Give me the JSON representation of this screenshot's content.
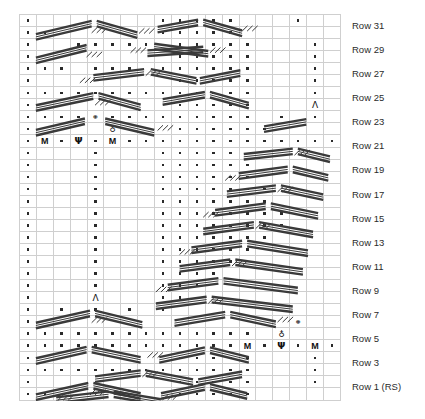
{
  "chart": {
    "columns": 19,
    "rows": 32,
    "cell_width_px": 16.9,
    "cell_height_px": 12.05,
    "colors": {
      "grid_line": "#cfcfcf",
      "border": "#9a9a9a",
      "shaded_cell": "#6e6e6e",
      "background_cell": "#ffffff",
      "symbol": "#2a2a2a",
      "cable_stroke": "#3a3a3a",
      "label_text": "#2b2b2b"
    },
    "row_labels": [
      "Row 31",
      "Row 29",
      "Row 27",
      "Row 25",
      "Row 23",
      "Row 21",
      "Row 19",
      "Row 17",
      "Row 15",
      "Row 13",
      "Row 11",
      "Row 9",
      "Row 7",
      "Row 5",
      "Row 3",
      "Row 1 (RS)"
    ],
    "row_label_numbers": [
      31,
      29,
      27,
      25,
      23,
      21,
      19,
      17,
      15,
      13,
      11,
      9,
      7,
      5,
      3,
      1
    ],
    "rs_marker": "(RS)",
    "symbol_legend": [
      {
        "key": "purl",
        "glyph": "dot",
        "name": "purl-dot-symbol"
      },
      {
        "key": "shaded",
        "glyph": "block",
        "name": "shaded-cell-symbol"
      },
      {
        "key": "make_one",
        "glyph": "M",
        "name": "make-one-symbol"
      },
      {
        "key": "psy",
        "glyph": "Ψ",
        "name": "psi-symbol"
      },
      {
        "key": "central_dec",
        "glyph": "Λ",
        "name": "central-decrease-symbol"
      },
      {
        "key": "bobble_top",
        "glyph": "♀",
        "name": "bobble-symbol"
      },
      {
        "key": "bobble_bottom",
        "glyph": "♁",
        "name": "bobble-lower-symbol"
      },
      {
        "key": "cable",
        "glyph": "diagonal-line",
        "name": "travelling-stitch-symbol"
      }
    ],
    "grid": [
      "dggg.ggg.......d.ddd.dddd.d",
      "d...............d.d..d...d.",
      "dggg.ggg.......d.ddd.dddd.d"
    ],
    "cells": [
      [
        "d",
        "b",
        "b",
        "b",
        "d",
        "b",
        "b",
        "b",
        "d",
        "d",
        "d",
        "d",
        "d",
        "d",
        "g",
        "g",
        "g",
        "d",
        "g",
        "g",
        "g",
        "d"
      ],
      [
        "d",
        "d",
        "b",
        "b",
        "b",
        "b",
        "b",
        "d",
        "d",
        "d",
        "d",
        "d",
        "d",
        "d",
        "g",
        "g",
        "g",
        "d",
        "g",
        "g",
        "g",
        "d"
      ]
    ],
    "map": {
      "d": "purl dot",
      "b": "blank / travelling stitch",
      "g": "shaded (knit ground)",
      "M": "make one",
      "P": "psi",
      "L": "central decrease",
      "o": "bobble upper",
      "u": "bobble lower"
    },
    "row_data": [
      "d.b.b.bbdddddgggdgggd",
      "ddbbbbbbddddd.ggg.gggd",
      "d..ddddd.dddddgggdgggd",
      "dbbbbbbbbdddddgggdgggd",
      "ddd.ddd.ddddddgggdgggd",
      "dbbbbbbbbdddddgggdgggd",
      "ddddddddddddddgggdgggd",
      "dbbbbbbbbdddddgggLgggd",
      "ddddoddddddddd.d.d.d.d",
      "dbbbbubbbddddddbbbbbbd",
      "dMdPdMddddddddddddddd",
      "dgggdgggddddd.bbbbbb.d",
      "dgggdgggddddddbbbbbbbd",
      "dgggdgggdddddd.bbbbb.d",
      "dgggdgggdddddddbbbbbdd",
      "dgggdgggddddddd.bbb..d",
      "dgggdgggdddddddd.b.ddd",
      "dgggdgggddddddddbbbbdd",
      "dgggdgggdddddddbbbbbbd",
      "dgggdgggddddddbbbbbbbd",
      "dgggdgggdddddbbbbbbbbd",
      "dgggdgggddddbbbbbbbbbd",
      "dgggdgggdddbbbbbbbbbbd",
      "dgggLgggddbbbbbbbbbbbd",
      "d.d.d.d.dbbbbbbbbbbbbd",
      "dbbbbbbbbbbbbbbbobbbbd",
      "ddddddddddddddbubbbbdd",
      "dddddddddddddMdPdMdddd",
      "dbbbbbbbbdddddgggdgggd",
      "ddddddddddddddgggdgggd",
      "dbbbbbbbbdddddgggdgggd",
      "ddbbbbbbbddddd.ggg.gggd"
    ]
  },
  "cable_paths": {
    "description": "travelling stitch diagonal strokes rendered as SVG lines over the grid",
    "stroke_color": "#3a3a3a",
    "thick_width": 2.4,
    "thin_width": 1.0
  }
}
